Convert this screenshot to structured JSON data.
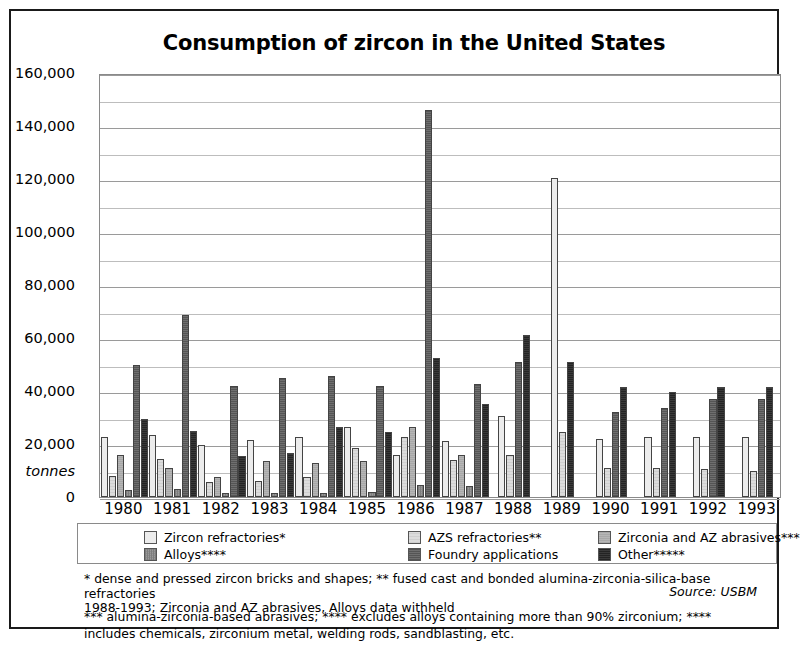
{
  "chart_data": {
    "type": "bar",
    "title": "Consumption of zircon in the United States",
    "xlabel": "",
    "ylabel": "tonnes",
    "ylim": [
      0,
      160000
    ],
    "ytick_step": 20000,
    "ytick_labels": [
      "160,000",
      "140,000",
      "120,000",
      "100,000",
      "80,000",
      "60,000",
      "40,000",
      "20,000",
      "0"
    ],
    "ytick_values": [
      160000,
      140000,
      120000,
      100000,
      80000,
      60000,
      40000,
      20000,
      0
    ],
    "minor_gridlines": true,
    "minor_step": 10000,
    "grid": true,
    "legend_position": "bottom",
    "categories": [
      "1980",
      "1981",
      "1982",
      "1983",
      "1984",
      "1985",
      "1986",
      "1987",
      "1988",
      "1989",
      "1990",
      "1991",
      "1992",
      "1993"
    ],
    "series": [
      {
        "name": "Zircon refractories*",
        "pattern": "p-zircon",
        "values": [
          22500,
          23500,
          19500,
          21500,
          22500,
          26500,
          16000,
          21000,
          30500,
          120500,
          22000,
          22500,
          22500,
          22500
        ]
      },
      {
        "name": "AZS refractories**",
        "pattern": "p-azs",
        "values": [
          8000,
          14500,
          5500,
          6000,
          7500,
          18500,
          22500,
          14000,
          16000,
          24500,
          11000,
          11000,
          10500,
          10000
        ]
      },
      {
        "name": "Zirconia and AZ abrasives***",
        "pattern": "p-zirconia",
        "values": [
          16000,
          11000,
          7500,
          13500,
          13000,
          13500,
          26500,
          16000,
          null,
          null,
          null,
          null,
          null,
          null
        ]
      },
      {
        "name": "Alloys****",
        "pattern": "p-alloys",
        "values": [
          2500,
          3000,
          1500,
          1500,
          1500,
          2000,
          4500,
          4000,
          null,
          null,
          null,
          null,
          null,
          null
        ]
      },
      {
        "name": "Foundry applications",
        "pattern": "p-foundry",
        "values": [
          50000,
          68500,
          42000,
          45000,
          45500,
          42000,
          146000,
          42500,
          51000,
          null,
          32000,
          33500,
          37000,
          37000
        ]
      },
      {
        "name": "Other*****",
        "pattern": "p-other",
        "values": [
          29500,
          25000,
          15500,
          16500,
          26500,
          24500,
          52500,
          35000,
          61000,
          51000,
          41500,
          39500,
          41500,
          41500
        ]
      }
    ]
  },
  "axis": {
    "y_unit_label": "tonnes"
  },
  "legend": {
    "items": [
      {
        "label": "Zircon refractories*",
        "pattern": "p-zircon"
      },
      {
        "label": "AZS refractories**",
        "pattern": "p-azs"
      },
      {
        "label": "Zirconia and AZ abrasives***",
        "pattern": "p-zirconia"
      },
      {
        "label": "Alloys****",
        "pattern": "p-alloys"
      },
      {
        "label": "Foundry applications",
        "pattern": "p-foundry"
      },
      {
        "label": "Other*****",
        "pattern": "p-other"
      }
    ]
  },
  "notes": {
    "line1": "* dense and pressed zircon bricks and shapes; ** fused cast and bonded alumina-zirconia-silica-base refractories",
    "line2": "*** alumina-zirconia-based abrasives; **** excludes alloys containing more than 90% zirconium; ****",
    "line3": "includes chemicals, zirconium metal, welding rods, sandblasting, etc.",
    "withheld": "1988-1993; Zirconia and AZ abrasives, Alloys data withheld",
    "source": "Source: USBM"
  }
}
